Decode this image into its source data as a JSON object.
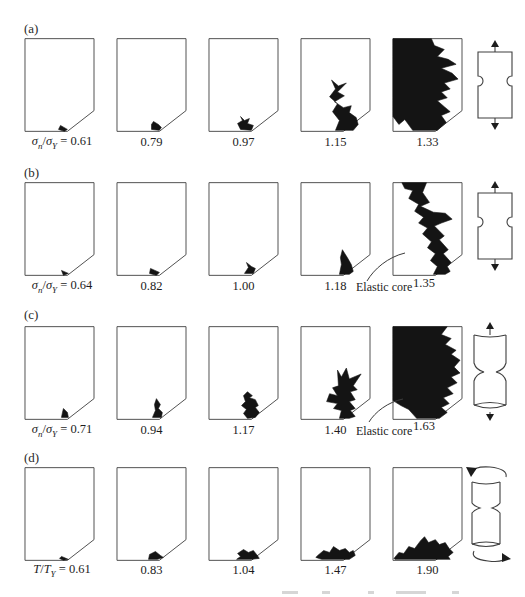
{
  "figure": {
    "elastic_core_text": "Elastic core",
    "icons": {
      "row_a": "double-notched-plate-tension-icon",
      "row_b": "double-notched-plate-tension-icon",
      "row_c": "notched-round-bar-tension-icon",
      "row_d": "notched-round-bar-torsion-icon"
    },
    "rows": [
      {
        "panel_label": "(a)",
        "ratio": {
          "sym1": "σ",
          "sub1": "n",
          "sep": "/",
          "sym2": "σ",
          "sub2": "Y",
          "eq": " = 0.61"
        },
        "annotation": "",
        "panels": [
          {
            "value": "0.61",
            "zone": "37,89 44,93 41,95 35,93"
          },
          {
            "value": "0.79",
            "zone": "38,85 43,88 46,91 44,94 36,93 36,88"
          },
          {
            "value": "0.97",
            "zone": "33,80 37,84 42,82 40,87 46,89 44,94 33,93 30,87 35,84"
          },
          {
            "value": "1.15",
            "zone": "32,43 39,49 47,46 38,55 45,59 35,65 44,71 52,69 50,76 57,81 59,88 54,94 36,94 40,84 33,75 38,67 30,60 36,52"
          },
          {
            "value": "1.33",
            "zone": "1,1 40,1 43,8 53,12 46,19 57,22 65,27 50,31 61,36 67,42 53,46 59,52 50,55 56,61 46,64 53,70 59,75 50,79 55,86 46,94 21,94 13,83 7,88 1,80"
          }
        ]
      },
      {
        "panel_label": "(b)",
        "ratio": {
          "sym1": "σ",
          "sub1": "n",
          "sep": "/",
          "sym2": "σ",
          "sub2": "Y",
          "eq": " = 0.64"
        },
        "annotation": "Elastic core",
        "panels": [
          {
            "value": "0.64",
            "zone": "38,90 45,93 40,95"
          },
          {
            "value": "0.82",
            "zone": "35,88 44,92 41,95 34,93"
          },
          {
            "value": "1.00",
            "zone": "39,82 44,86 48,88 46,93 37,93 41,87"
          },
          {
            "value": "1.18",
            "zone": "43,69 48,77 52,84 54,91 50,94 40,94 42,84 41,77"
          },
          {
            "value": "1.35",
            "zone": "10,1 35,1 31,11 38,21 29,25 42,31 54,32 61,38 50,42 43,45 53,55 48,59 57,69 52,73 60,82 56,86 59,91 54,94 42,94 46,86 39,80 44,73 36,67 40,61 31,53 36,47 27,42 32,36 23,30 27,23 17,17 21,9 13,7"
          }
        ]
      },
      {
        "panel_label": "(c)",
        "ratio": {
          "sym1": "σ",
          "sub1": "n",
          "sep": "/",
          "sym2": "σ",
          "sub2": "Y",
          "eq": " = 0.71"
        },
        "annotation": "Elastic core",
        "panels": [
          {
            "value": "0.71",
            "zone": "40,84 44,88 45,93 38,93 39,88"
          },
          {
            "value": "0.94",
            "zone": "41,74 45,80 43,84 47,88 46,93 37,93 40,86 39,80"
          },
          {
            "value": "1.17",
            "zone": "40,67 45,71 42,73 48,75 51,81 48,83 52,88 48,93 40,94 36,89 39,85 34,81 38,77 36,71"
          },
          {
            "value": "1.40",
            "zone": "38,45 42,52 47,43 50,54 62,49 54,61 58,65 51,67 56,75 50,77 56,84 51,86 56,92 50,94 40,94 42,86 34,84 38,79 27,77 30,69 38,71 33,63 39,61"
          },
          {
            "value": "1.63",
            "zone": "1,1 56,1 50,9 60,13 54,19 65,25 60,29 69,35 63,42 69,48 60,52 66,58 56,63 62,69 52,73 58,79 50,83 56,88 48,94 25,94 17,85 9,81 1,76"
          }
        ]
      },
      {
        "panel_label": "(d)",
        "ratio": {
          "sym1": "T",
          "sub1": "",
          "sep": "/",
          "sym2": "T",
          "sub2": "Y",
          "eq": " = 0.61"
        },
        "annotation": "",
        "panels": [
          {
            "value": "0.61",
            "zone": "38,91 45,94 40,95 36,93"
          },
          {
            "value": "0.83",
            "zone": "34,89 40,86 45,90 48,92 42,94 33,94"
          },
          {
            "value": "1.04",
            "zone": "30,88 36,84 41,87 46,85 50,90 52,93 44,94 29,94 33,91"
          },
          {
            "value": "1.47",
            "zone": "18,90 24,85 30,87 34,81 40,85 46,83 50,87 54,85 56,90 50,94 22,94 16,92"
          },
          {
            "value": "1.90",
            "zone": "2,93 7,87 12,88 17,81 23,83 29,75 33,71 37,77 44,74 48,79 54,77 58,83 62,87 57,91 59,94 3,94"
          }
        ]
      }
    ]
  }
}
